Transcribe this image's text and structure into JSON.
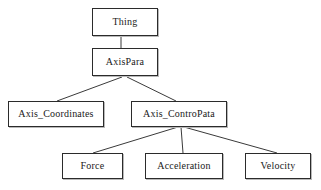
{
  "diagram": {
    "type": "tree",
    "style": {
      "background": "#ffffff",
      "node_fill": "#ffffff",
      "node_border": "#2b2b2b",
      "node_shadow": "#b9b9b9",
      "edge_color": "#3a3a3a",
      "text_color": "#1a1a1a"
    },
    "nodes": [
      {
        "id": "thing",
        "label": "Thing",
        "level": 0
      },
      {
        "id": "axispara",
        "label": "AxisPara",
        "level": 1
      },
      {
        "id": "axis_coordinates",
        "label": "Axis_Coordinates",
        "level": 2
      },
      {
        "id": "axis_contropata",
        "label": "Axis_ControPata",
        "level": 2
      },
      {
        "id": "force",
        "label": "Force",
        "level": 3
      },
      {
        "id": "acceleration",
        "label": "Acceleration",
        "level": 3
      },
      {
        "id": "velocity",
        "label": "Velocity",
        "level": 3
      }
    ],
    "edges": [
      {
        "from": "thing",
        "to": "axispara",
        "x1": 121,
        "y1": 36,
        "x2": 121,
        "y2": 48
      },
      {
        "from": "axispara",
        "to": "axis_coordinates",
        "x1": 122,
        "y1": 77,
        "x2": 57,
        "y2": 101
      },
      {
        "from": "axispara",
        "to": "axis_contropata",
        "x1": 127,
        "y1": 77,
        "x2": 176,
        "y2": 101
      },
      {
        "from": "axis_contropata",
        "to": "force",
        "x1": 178,
        "y1": 127,
        "x2": 93,
        "y2": 153
      },
      {
        "from": "axis_contropata",
        "to": "acceleration",
        "x1": 181,
        "y1": 127,
        "x2": 183,
        "y2": 153
      },
      {
        "from": "axis_contropata",
        "to": "velocity",
        "x1": 184,
        "y1": 127,
        "x2": 277,
        "y2": 153
      }
    ]
  }
}
